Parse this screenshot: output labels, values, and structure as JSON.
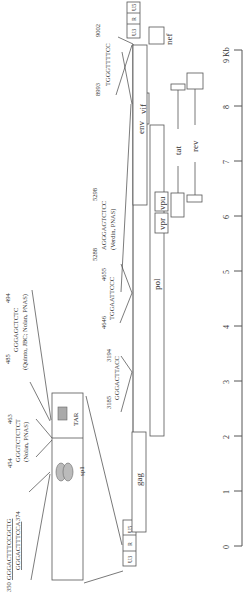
{
  "diagram": {
    "orientation": "rotated 90 degrees counter-clockwise",
    "scale": {
      "unit_label": "9 Kb",
      "ticks": [
        "0",
        "1",
        "2",
        "3",
        "4",
        "5",
        "6",
        "7",
        "8",
        "9 Kb"
      ]
    },
    "ltr_5": {
      "segments": [
        "U3",
        "R",
        "U5"
      ]
    },
    "ltr_3": {
      "segments": [
        "U3",
        "R",
        "U5"
      ]
    },
    "genes": {
      "gag": "gag",
      "pol": "pol",
      "vif": "vif",
      "vpr": "vpr",
      "vpu": "vpu",
      "env": "env",
      "nef": "nef",
      "tat": "tat",
      "rev": "rev"
    },
    "ltr_detail": {
      "sp1_label": "sp1",
      "tar_label": "TAR",
      "kb_site": {
        "start": "350",
        "seq1": "GGGACTTTCCGCTG",
        "seq2": "GGGACTTTCCA",
        "end": "374"
      },
      "site_454": {
        "start": "454",
        "end": "463",
        "seq": "GGGTCTCTCT",
        "ref": "(Nolan, PNAS)"
      },
      "site_485": {
        "start": "485",
        "end": "494",
        "seq": "GGGAGCTCTC",
        "ref": "(Quinto, JBC; Nolan, PNAS)"
      }
    },
    "sites": {
      "s3185": {
        "start": "3185",
        "end": "3194",
        "seq": "GGGACTTACC"
      },
      "s4646": {
        "start": "4646",
        "end": "4655",
        "seq": "TGGAATTCCC"
      },
      "s5288": {
        "start": "5288",
        "end": "5298",
        "seq": "AGGGAGTCTCC",
        "ref": "(Verdin, PNAS)"
      },
      "s8993": {
        "start": "8993",
        "end": "9002",
        "seq": "TGGGTTTTCC"
      }
    }
  }
}
